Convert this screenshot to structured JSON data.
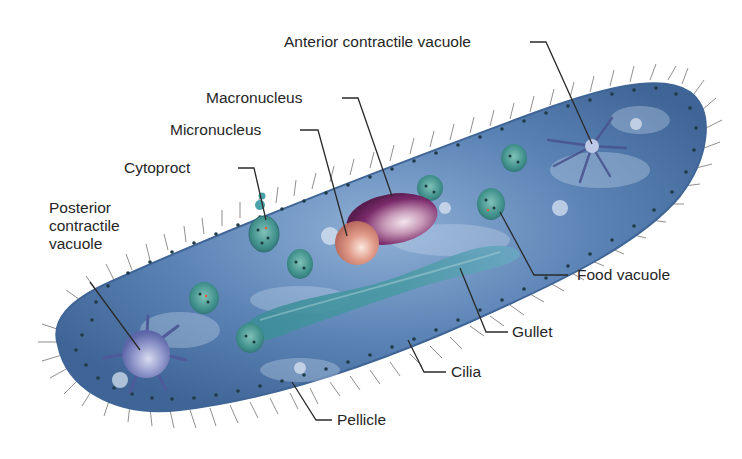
{
  "diagram": {
    "colors": {
      "body_fill": "#5b83b5",
      "body_dark": "#3f6596",
      "body_light": "#9fbbd9",
      "cilia": "#6e6a66",
      "pellicle_dots": "#1e3a46",
      "macronucleus": "#7a2a6a",
      "micronucleus": "#d98a7a",
      "gullet": "#3e8a9a",
      "food_vacuole": "#3f8f8a",
      "contractile_vacuole": "#6f79b8",
      "leader_line": "#2a2a2a",
      "text": "#262626"
    },
    "labels": {
      "anterior_contractile_vacuole": "Anterior contractile vacuole",
      "macronucleus": "Macronucleus",
      "micronucleus": "Micronucleus",
      "cytoproct": "Cytoproct",
      "posterior_contractile_vacuole": [
        "Posterior",
        "contractile",
        "vacuole"
      ],
      "food_vacuole": "Food vacuole",
      "gullet": "Gullet",
      "cilia": "Cilia",
      "pellicle": "Pellicle"
    }
  }
}
